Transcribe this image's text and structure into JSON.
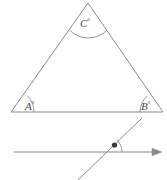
{
  "figure": {
    "stroke_color": "#8a8a8a",
    "label_color": "#4a4a4a",
    "background_color": "#ffffff",
    "marker_color": "#3a3a3a"
  },
  "triangle": {
    "name": "triangle-ABC",
    "vertices": {
      "apex": {
        "label_key": "C",
        "x": 88,
        "y": 3
      },
      "bottom_left": {
        "label_key": "A",
        "x": 11,
        "y": 112
      },
      "bottom_right": {
        "label_key": "B",
        "x": 163,
        "y": 112
      }
    },
    "angles": [
      {
        "name": "angle-A",
        "text": "A",
        "degree_symbol": "°",
        "x": 26,
        "y": 108
      },
      {
        "name": "angle-B",
        "text": "B",
        "degree_symbol": "°",
        "x": 142,
        "y": 108
      },
      {
        "name": "angle-C",
        "text": "C",
        "degree_symbol": "°",
        "x": 81,
        "y": 25
      }
    ]
  },
  "transversal_figure": {
    "name": "ray-with-transversal",
    "ray": {
      "name": "horizontal-ray",
      "start_x": 14,
      "end_x": 160,
      "y": 152,
      "arrowhead": "right-arrowhead"
    },
    "transversal": {
      "name": "transversal-line",
      "x1": 78,
      "y1": 180,
      "x2": 142,
      "y2": 118
    },
    "marked_angle": {
      "name": "marked-angle-dot",
      "marker": "filled-dot",
      "arc_radius": 17,
      "vertex_x": 105,
      "vertex_y": 152
    }
  },
  "labels": {
    "A": "A",
    "B": "B",
    "C": "C",
    "degree": "°"
  }
}
